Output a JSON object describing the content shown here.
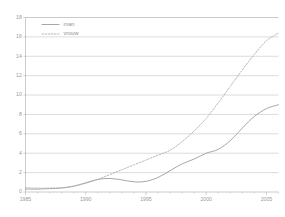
{
  "chart_data": {
    "type": "line",
    "title": "",
    "subtitle": "",
    "xlabel": "",
    "ylabel": "",
    "xlim": [
      1985,
      2006
    ],
    "ylim": [
      0,
      18
    ],
    "ytick_step": 2,
    "xtick_step": 5,
    "grid": "horizontal",
    "legend_position": "top-left-inside",
    "yticks": [
      "0",
      "2",
      "4",
      "6",
      "8",
      "10",
      "12",
      "14",
      "16",
      "18"
    ],
    "ytick_values": [
      0,
      2,
      4,
      6,
      8,
      10,
      12,
      14,
      16,
      18
    ],
    "xticks": [
      "1985",
      "1990",
      "1995",
      "2000",
      "2005"
    ],
    "xtick_values": [
      1985,
      1990,
      1995,
      2000,
      2005
    ],
    "x": [
      1985,
      1986,
      1987,
      1988,
      1989,
      1990,
      1991,
      1992,
      1993,
      1994,
      1995,
      1996,
      1997,
      1998,
      1999,
      2000,
      2001,
      2002,
      2003,
      2004,
      2005,
      2006
    ],
    "series": [
      {
        "name": "man",
        "style": "solid",
        "color": "#9d9d9d",
        "values": [
          0.3,
          0.3,
          0.35,
          0.4,
          0.6,
          0.95,
          1.3,
          1.4,
          1.25,
          1.05,
          1.1,
          1.5,
          2.2,
          2.9,
          3.4,
          4.0,
          4.4,
          5.3,
          6.6,
          7.8,
          8.6,
          9.0
        ]
      },
      {
        "name": "vrouw",
        "style": "dotted",
        "color": "#b0b0b0",
        "values": [
          0.45,
          0.4,
          0.4,
          0.45,
          0.6,
          0.9,
          1.3,
          1.8,
          2.3,
          2.8,
          3.3,
          3.8,
          4.3,
          5.2,
          6.3,
          7.6,
          9.2,
          10.9,
          12.6,
          14.2,
          15.6,
          16.4
        ]
      }
    ],
    "legend": [
      {
        "label": "man",
        "style": "solid"
      },
      {
        "label": "vrouw",
        "style": "dotted"
      }
    ]
  },
  "colors": {
    "background": "#ffffff",
    "grid": "#b9b9b9",
    "axis": "#a8a8a8",
    "text": "#9a9a9a",
    "man": "#9d9d9d",
    "vrouw": "#b0b0b0"
  }
}
